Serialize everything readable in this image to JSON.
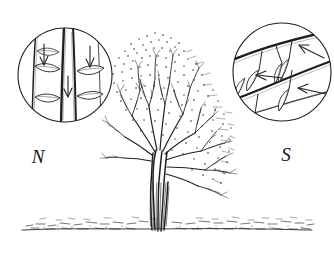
{
  "figure": {
    "background_color": "#ffffff",
    "ink_color": "#1a1a1e",
    "medium": "pen-and-ink line drawing"
  },
  "labels": {
    "north": "N",
    "south": "S"
  },
  "insets": {
    "left": {
      "name": "north-side-inset",
      "label": "N",
      "cx": 65,
      "cy": 75,
      "r": 48,
      "description": "magnified detail of north-facing twigs: steeply vertical shoots with paired leaves",
      "branch_orientation": "vertical",
      "arrow_direction": "down",
      "arrow_count": 3,
      "leaf_count": 5
    },
    "right": {
      "name": "south-side-inset",
      "label": "S",
      "cx": 282,
      "cy": 72,
      "r": 50,
      "description": "magnified detail of south-facing twigs: shallow horizontal branches with spreading leaves",
      "branch_orientation": "horizontal-diagonal",
      "arrow_direction": "left",
      "arrow_count": 3,
      "leaf_count": 6
    }
  },
  "tree": {
    "name": "central-tree",
    "canopy_top_y": 32,
    "canopy_bottom_y": 175,
    "canopy_left_x": 112,
    "canopy_right_x": 238,
    "trunk_base_x": 157,
    "trunk_base_y": 232,
    "ground_line_y": 228,
    "form": "multi-stemmed bare deciduous tree with dense twiggy crown swept to the right"
  },
  "ground": {
    "name": "ground-line",
    "y": 228,
    "description": "stippled horizontal band of low ground cover spanning the full image width"
  }
}
